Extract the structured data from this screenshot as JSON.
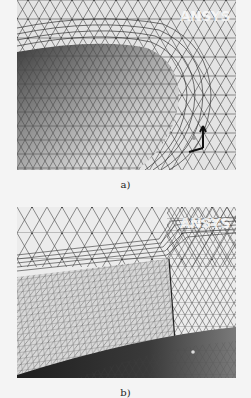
{
  "figure": {
    "panels": [
      {
        "id": "a",
        "caption": "a)",
        "watermark": "ANSYS",
        "description": "Tetrahedral surface mesh around a rounded (U-shaped) body with inflation layers along its edge; coordinate triad in lower right",
        "colors": {
          "background": "#e6e6e6",
          "mesh_line": "#3a3a3a",
          "body_dark": "#5a5a5a",
          "body_mid": "#9a9a9a"
        }
      },
      {
        "id": "b",
        "caption": "b)",
        "watermark": "ANSYS",
        "description": "Fine structured mesh on a rectangular block face with inflation layers at the corner, coarse triangular mesh above and dark shaded surface below",
        "colors": {
          "background": "#ececec",
          "mesh_line": "#3a3a3a",
          "dark_region": "#2a2a2a"
        }
      }
    ]
  }
}
